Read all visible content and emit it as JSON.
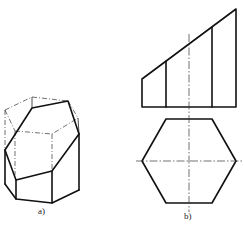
{
  "figure": {
    "panels": [
      {
        "id": "a",
        "label": "a)",
        "description": "Isometric view of hexagonal prism truncated by an inclined plane"
      },
      {
        "id": "b",
        "label": "b)",
        "description": "Front view (truncated prism elevation) and top view (hexagon) with center lines"
      }
    ],
    "colors": {
      "line": "#111111",
      "background": "#ffffff"
    }
  }
}
